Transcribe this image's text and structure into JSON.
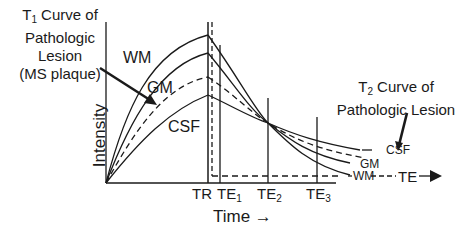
{
  "annotations": {
    "t1_title_prefix": "T",
    "t1_title_sub": "1",
    "t1_title_rest": " Curve of",
    "t1_line2": "Pathologic",
    "t1_line3": "Lesion",
    "t1_line4": "(MS plaque)",
    "t2_title_prefix": "T",
    "t2_title_sub": "2",
    "t2_title_rest": " Curve of",
    "t2_line2": "Pathologic Lesion"
  },
  "curve_labels": {
    "wm_left": "WM",
    "gm_left": "GM",
    "csf_left": "CSF",
    "csf_right": "CSF",
    "gm_right": "GM",
    "wm_right": "WM"
  },
  "axes": {
    "ylabel": "Intensity",
    "xlabel": "Time →",
    "te_arrow_label": "TE"
  },
  "ticks": [
    {
      "main": "TR",
      "sub": ""
    },
    {
      "main": "TE",
      "sub": "1"
    },
    {
      "main": "TE",
      "sub": "2"
    },
    {
      "main": "TE",
      "sub": "3"
    }
  ],
  "colors": {
    "line": "#1a1a1a",
    "background": "#ffffff"
  }
}
